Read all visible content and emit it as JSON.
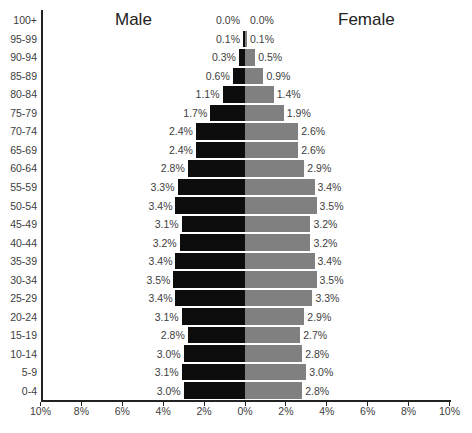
{
  "chart_data": {
    "type": "bar",
    "orientation": "horizontal",
    "subtype": "population-pyramid",
    "title": "",
    "xlabel": "",
    "ylabel": "",
    "categories": [
      "0-4",
      "5-9",
      "10-14",
      "15-19",
      "20-24",
      "25-29",
      "30-34",
      "35-39",
      "40-44",
      "45-49",
      "50-54",
      "55-59",
      "60-64",
      "65-69",
      "70-74",
      "75-79",
      "80-84",
      "85-89",
      "90-94",
      "95-99",
      "100+"
    ],
    "series": [
      {
        "name": "Male",
        "color": "#0d0d0d",
        "side": "left",
        "values": [
          3.0,
          3.1,
          3.0,
          2.8,
          3.1,
          3.4,
          3.5,
          3.4,
          3.2,
          3.1,
          3.4,
          3.3,
          2.8,
          2.4,
          2.4,
          1.7,
          1.1,
          0.6,
          0.3,
          0.1,
          0.0
        ],
        "labels": [
          "3.0%",
          "3.1%",
          "3.0%",
          "2.8%",
          "3.1%",
          "3.4%",
          "3.5%",
          "3.4%",
          "3.2%",
          "3.1%",
          "3.4%",
          "3.3%",
          "2.8%",
          "2.4%",
          "2.4%",
          "1.7%",
          "1.1%",
          "0.6%",
          "0.3%",
          "0.1%",
          "0.0%"
        ]
      },
      {
        "name": "Female",
        "color": "#808080",
        "side": "right",
        "values": [
          2.8,
          3.0,
          2.8,
          2.7,
          2.9,
          3.3,
          3.5,
          3.4,
          3.2,
          3.2,
          3.5,
          3.4,
          2.9,
          2.6,
          2.6,
          1.9,
          1.4,
          0.9,
          0.5,
          0.1,
          0.0
        ],
        "labels": [
          "2.8%",
          "3.0%",
          "2.8%",
          "2.7%",
          "2.9%",
          "3.3%",
          "3.5%",
          "3.4%",
          "3.2%",
          "3.2%",
          "3.5%",
          "3.4%",
          "2.9%",
          "2.6%",
          "2.6%",
          "1.9%",
          "1.4%",
          "0.9%",
          "0.5%",
          "0.1%",
          "0.0%"
        ]
      }
    ],
    "x_ticks": [
      "10%",
      "8%",
      "6%",
      "4%",
      "2%",
      "0%",
      "2%",
      "4%",
      "6%",
      "8%",
      "10%"
    ],
    "xlim": [
      -10,
      10
    ],
    "grid": false,
    "legend": "none",
    "annotations": [
      "Male",
      "Female"
    ]
  },
  "titles": {
    "male": "Male",
    "female": "Female"
  }
}
